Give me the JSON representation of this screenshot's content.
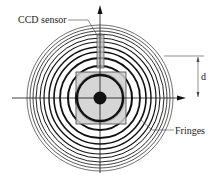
{
  "diagram": {
    "labels": {
      "ccd_sensor": "CCD sensor",
      "fringes": "Fringes",
      "distance": "d"
    },
    "center": {
      "x": 100,
      "y": 98
    },
    "rings": [
      {
        "r": 24,
        "w": 2.4
      },
      {
        "r": 32,
        "w": 2.0
      },
      {
        "r": 40,
        "w": 1.8
      },
      {
        "r": 46,
        "w": 1.6
      },
      {
        "r": 51,
        "w": 1.4
      },
      {
        "r": 56,
        "w": 1.2
      },
      {
        "r": 60,
        "w": 1.0
      },
      {
        "r": 64,
        "w": 0.9
      },
      {
        "r": 67,
        "w": 0.8
      },
      {
        "r": 70,
        "w": 0.7
      },
      {
        "r": 73,
        "w": 0.6
      }
    ],
    "colors": {
      "ink": "#111111",
      "square_fill": "#cfcfcf",
      "sensor_fill": "#bdbdbd"
    }
  }
}
